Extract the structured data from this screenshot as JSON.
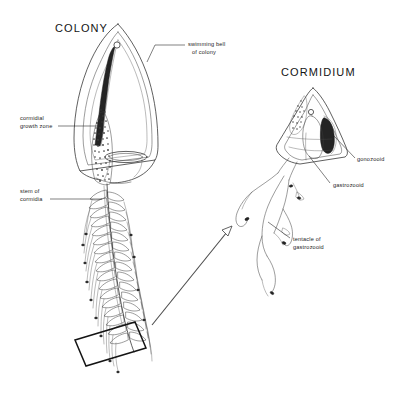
{
  "figure": {
    "background_color": "#ffffff",
    "ink_color": "#2b2b2b"
  },
  "titles": {
    "colony": "COLONY",
    "cormidium": "CORMIDIUM"
  },
  "labels": {
    "swimming_bell": {
      "line1": "swimming bell",
      "line2": "of colony"
    },
    "cormidial_growth_zone": {
      "line1": "cormidial",
      "line2": "growth zone"
    },
    "stem_of_cormidia": {
      "line1": "stem of",
      "line2": "cormidia"
    },
    "gonozooid": {
      "line1": "gonozooid"
    },
    "gastrozooid": {
      "line1": "gastrozooid"
    },
    "tentacle_of_gastrozooid": {
      "line1": "tentacle of",
      "line2": "gastrozooid"
    }
  },
  "callout": {
    "magnifier_box_name": "detail-selection-box",
    "arrow_name": "magnification-arrow"
  }
}
